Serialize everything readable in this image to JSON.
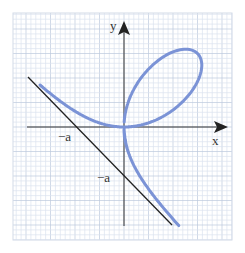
{
  "figure": {
    "type": "diagram",
    "axes": {
      "x_label": "x",
      "y_label": "y"
    },
    "labels": {
      "x_intercept": "−a",
      "y_intercept": "−a"
    },
    "colors": {
      "curve": "#7b93d6",
      "asymptote": "#222222",
      "axes": "#333333",
      "grid_minor": "#dbe3ef",
      "grid_major": "#bcc9dc",
      "background": "#ffffff"
    },
    "geometry": {
      "origin_px": [
        124,
        127
      ],
      "a_px": 49,
      "frame_px": [
        13,
        13,
        232,
        240
      ]
    }
  }
}
